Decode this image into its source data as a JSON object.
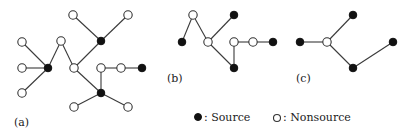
{
  "figure": {
    "panels": [
      {
        "id": "a",
        "label": "(a)",
        "label_pos": [
          14,
          126
        ],
        "nodes": [
          {
            "id": "a1",
            "x": 73,
            "y": 15,
            "type": "nonsource"
          },
          {
            "id": "a2",
            "x": 128,
            "y": 15,
            "type": "nonsource"
          },
          {
            "id": "a3",
            "x": 101,
            "y": 41,
            "type": "source"
          },
          {
            "id": "a4",
            "x": 22,
            "y": 42,
            "type": "nonsource"
          },
          {
            "id": "a5",
            "x": 22,
            "y": 68,
            "type": "nonsource"
          },
          {
            "id": "a6",
            "x": 22,
            "y": 93,
            "type": "nonsource"
          },
          {
            "id": "a7",
            "x": 48,
            "y": 68,
            "type": "source"
          },
          {
            "id": "a8",
            "x": 61,
            "y": 41,
            "type": "nonsource"
          },
          {
            "id": "a9",
            "x": 74,
            "y": 68,
            "type": "nonsource"
          },
          {
            "id": "a10",
            "x": 101,
            "y": 68,
            "type": "nonsource"
          },
          {
            "id": "a11",
            "x": 121,
            "y": 68,
            "type": "nonsource"
          },
          {
            "id": "a12",
            "x": 142,
            "y": 68,
            "type": "source"
          },
          {
            "id": "a13",
            "x": 101,
            "y": 93,
            "type": "source"
          },
          {
            "id": "a14",
            "x": 74,
            "y": 107,
            "type": "nonsource"
          },
          {
            "id": "a15",
            "x": 128,
            "y": 107,
            "type": "nonsource"
          }
        ],
        "edges": [
          [
            "a1",
            "a3"
          ],
          [
            "a2",
            "a3"
          ],
          [
            "a3",
            "a9"
          ],
          [
            "a4",
            "a7"
          ],
          [
            "a5",
            "a7"
          ],
          [
            "a6",
            "a7"
          ],
          [
            "a7",
            "a8"
          ],
          [
            "a8",
            "a9"
          ],
          [
            "a9",
            "a13"
          ],
          [
            "a10",
            "a13"
          ],
          [
            "a10",
            "a11"
          ],
          [
            "a11",
            "a12"
          ],
          [
            "a13",
            "a14"
          ],
          [
            "a13",
            "a15"
          ]
        ]
      },
      {
        "id": "b",
        "label": "(b)",
        "label_pos": [
          167,
          82
        ],
        "nodes": [
          {
            "id": "b1",
            "x": 193,
            "y": 15,
            "type": "nonsource"
          },
          {
            "id": "b2",
            "x": 234,
            "y": 15,
            "type": "source"
          },
          {
            "id": "b3",
            "x": 182,
            "y": 42,
            "type": "source"
          },
          {
            "id": "b4",
            "x": 208,
            "y": 42,
            "type": "nonsource"
          },
          {
            "id": "b5",
            "x": 234,
            "y": 42,
            "type": "nonsource"
          },
          {
            "id": "b6",
            "x": 253,
            "y": 42,
            "type": "nonsource"
          },
          {
            "id": "b7",
            "x": 273,
            "y": 42,
            "type": "source"
          },
          {
            "id": "b8",
            "x": 234,
            "y": 68,
            "type": "source"
          }
        ],
        "edges": [
          [
            "b3",
            "b1"
          ],
          [
            "b1",
            "b4"
          ],
          [
            "b4",
            "b2"
          ],
          [
            "b4",
            "b8"
          ],
          [
            "b5",
            "b8"
          ],
          [
            "b5",
            "b6"
          ],
          [
            "b6",
            "b7"
          ]
        ]
      },
      {
        "id": "c",
        "label": "(c)",
        "label_pos": [
          296,
          82
        ],
        "nodes": [
          {
            "id": "c1",
            "x": 353,
            "y": 15,
            "type": "source"
          },
          {
            "id": "c2",
            "x": 300,
            "y": 42,
            "type": "source"
          },
          {
            "id": "c3",
            "x": 327,
            "y": 42,
            "type": "nonsource"
          },
          {
            "id": "c4",
            "x": 353,
            "y": 68,
            "type": "source"
          },
          {
            "id": "c5",
            "x": 393,
            "y": 42,
            "type": "source"
          }
        ],
        "edges": [
          [
            "c2",
            "c3"
          ],
          [
            "c3",
            "c1"
          ],
          [
            "c3",
            "c4"
          ],
          [
            "c4",
            "c5"
          ]
        ]
      }
    ],
    "legend": {
      "source": {
        "symbol": "filled-circle",
        "label": ": Source",
        "x": 198,
        "y": 117
      },
      "nonsource": {
        "symbol": "open-circle",
        "label": ": Nonsource",
        "x": 277,
        "y": 117
      }
    },
    "colors": {
      "source": "#111111",
      "nonsource_fill": "#ffffff",
      "edge": "#3a3a3a"
    }
  }
}
